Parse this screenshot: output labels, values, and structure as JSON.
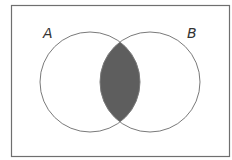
{
  "diagram": {
    "type": "venn",
    "universe": {
      "x": 11,
      "y": 5,
      "width": 218,
      "height": 152,
      "stroke": "#6f6f6f"
    },
    "sets": [
      {
        "label": "A",
        "cx": 90,
        "cy": 82,
        "r": 50,
        "label_x": 43,
        "label_y": 38
      },
      {
        "label": "B",
        "cx": 150,
        "cy": 82,
        "r": 50,
        "label_x": 187,
        "label_y": 38
      }
    ],
    "shaded_region": "A ∩ B",
    "shade_color": "#5e5e5e",
    "stroke_color": "#7a7a7a"
  }
}
